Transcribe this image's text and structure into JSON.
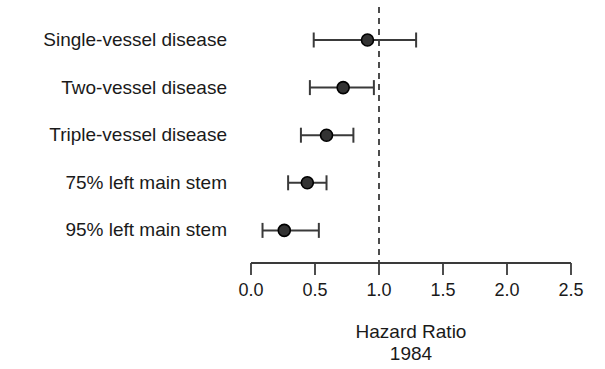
{
  "chart_data": {
    "type": "scatter",
    "variant": "forest-plot",
    "title": "",
    "categories": [
      "Single-vessel disease",
      "Two-vessel disease",
      "Triple-vessel disease",
      "75% left main stem",
      "95% left main stem"
    ],
    "series": [
      {
        "name": "Hazard ratio with 95% CI",
        "values": [
          0.91,
          0.72,
          0.59,
          0.44,
          0.26
        ],
        "ci_low": [
          0.49,
          0.46,
          0.39,
          0.29,
          0.09
        ],
        "ci_high": [
          1.29,
          0.96,
          0.8,
          0.59,
          0.53
        ]
      }
    ],
    "xlabel": "Hazard Ratio",
    "xlabel_secondary": "1984",
    "x_tick_labels": [
      "0.0",
      "0.5",
      "1.0",
      "1.5",
      "2.0",
      "2.5"
    ],
    "x_tick_values": [
      0,
      0.5,
      1.0,
      1.5,
      2.0,
      2.5
    ],
    "xlim": [
      0,
      2.5
    ],
    "reference_line_x": 1.0,
    "reference_line_style": "dashed",
    "grid": false,
    "legend_position": "none",
    "colors": {
      "marker_fill": "#333333",
      "marker_stroke": "#000000",
      "line": "#3a3a3a",
      "text": "#1a1a1a",
      "background": "#ffffff"
    }
  }
}
